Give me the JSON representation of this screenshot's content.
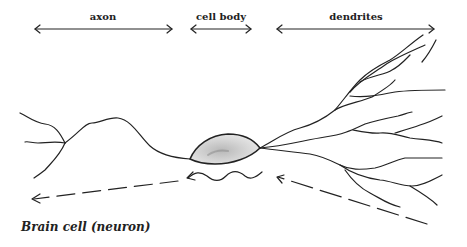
{
  "diagram": {
    "labels": {
      "axon": "axon",
      "cell_body": "cell body",
      "dendrites": "dendrites"
    },
    "caption": "Brain cell (neuron)",
    "colors": {
      "ink": "#222222",
      "cell_body_fill": "#d9d9d9",
      "background": "#ffffff"
    },
    "signal_direction": "right-to-left (dendrites → cell body → axon)"
  }
}
